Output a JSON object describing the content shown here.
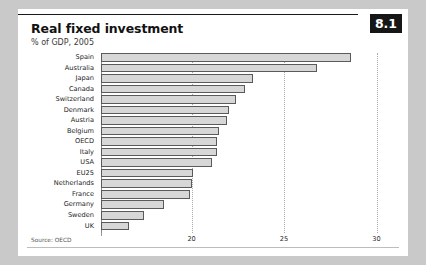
{
  "figure": {
    "badge": "8.1",
    "title": "Real fixed investment",
    "subtitle": "% of GDP, 2005",
    "source": "Source: OECD"
  },
  "chart_data": {
    "type": "bar",
    "orientation": "horizontal",
    "title": "Real fixed investment",
    "subtitle": "% of GDP, 2005",
    "xlabel": "",
    "ylabel": "",
    "xlim": [
      15.1,
      31.0
    ],
    "xticks": [
      20,
      25,
      30
    ],
    "xticklabels": [
      "20",
      "25",
      "30"
    ],
    "grid": true,
    "legend": null,
    "source": "Source: OECD",
    "categories": [
      "Spain",
      "Australia",
      "Japan",
      "Canada",
      "Switzerland",
      "Denmark",
      "Austria",
      "Belgium",
      "OECD",
      "Italy",
      "USA",
      "EU25",
      "Netherlands",
      "France",
      "Germany",
      "Sweden",
      "UK"
    ],
    "values": [
      28.6,
      26.8,
      23.3,
      22.9,
      22.4,
      22.0,
      21.9,
      21.5,
      21.4,
      21.4,
      21.1,
      20.1,
      20.0,
      19.9,
      18.5,
      17.4,
      16.6
    ]
  }
}
